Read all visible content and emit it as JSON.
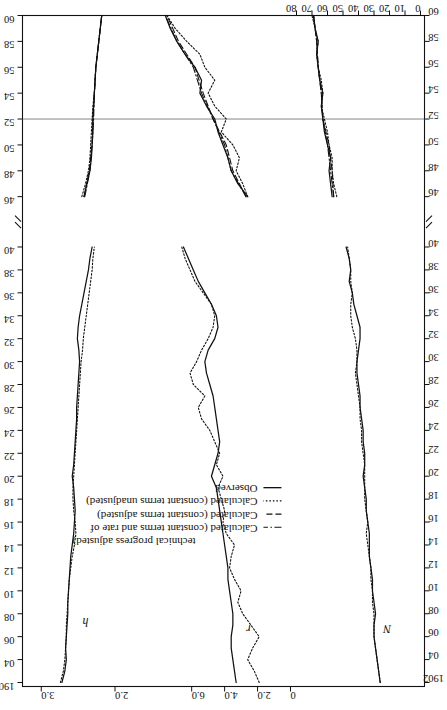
{
  "figure": {
    "orientation": "rotated-90-ccw",
    "background": "#ffffff",
    "ink": "#111111"
  },
  "legend": {
    "position": "center-bottom-of-rotated-figure",
    "items": [
      {
        "label": "Observed",
        "style": "solid"
      },
      {
        "label": "Calculated (constant terms unadjusted)",
        "style": "dotted"
      },
      {
        "label": "Calculated (constant terms adjusted)",
        "style": "dashed"
      },
      {
        "label": "Calculated (constant terms and rate of",
        "style": "dashdot"
      },
      {
        "label": "technical progress adjusted)",
        "style": "continuation"
      }
    ]
  },
  "series_labels": {
    "h": "h",
    "r": "r",
    "N": "N"
  },
  "axis_break": {
    "symbol": "//",
    "between": [
      "40",
      "46"
    ]
  },
  "chart_data": {
    "type": "line",
    "title": "",
    "subtitle": "",
    "xlabel": "",
    "ylabel": "",
    "grid": false,
    "legend_position": "bottom-center",
    "x_axis": {
      "name": "year",
      "tick_labels": [
        "1902",
        "04",
        "06",
        "08",
        "10",
        "12",
        "14",
        "16",
        "18",
        "20",
        "22",
        "24",
        "26",
        "28",
        "30",
        "32",
        "34",
        "36",
        "38",
        "40",
        "//",
        "46",
        "48",
        "50",
        "52",
        "54",
        "56",
        "58",
        "60"
      ],
      "break_after": "40",
      "break_before": "46",
      "duplicated_on_opposite_side": true
    },
    "y_axes": [
      {
        "panel": "h",
        "tick_labels": [
          "3.0",
          "2.0"
        ],
        "values": [
          3.0,
          2.0
        ],
        "note": "hours index panel, upper strip"
      },
      {
        "panel": "r",
        "tick_labels": [
          "6.0",
          "4.0",
          "2.0",
          "0"
        ],
        "values": [
          6.0,
          4.0,
          2.0,
          0
        ],
        "note": "rate panel, middle strip"
      },
      {
        "panel": "N",
        "tick_labels": [
          "80",
          "70",
          "60",
          "50",
          "40",
          "30",
          "20",
          "10",
          "0"
        ],
        "values": [
          80,
          70,
          60,
          50,
          40,
          30,
          20,
          10,
          0
        ],
        "note": "employment panel, lower strip; scale drawn on opposite side"
      }
    ],
    "panels": [
      {
        "name": "h",
        "label": "h",
        "ylim": [
          1.6,
          3.2
        ],
        "series": [
          {
            "name": "Observed",
            "style": "solid",
            "x": [
              1902,
              1903,
              1904,
              1905,
              1906,
              1907,
              1908,
              1909,
              1910,
              1911,
              1912,
              1913,
              1914,
              1915,
              1916,
              1917,
              1918,
              1919,
              1920,
              1921,
              1922,
              1923,
              1924,
              1925,
              1926,
              1927,
              1928,
              1929,
              1930,
              1931,
              1932,
              1933,
              1934,
              1935,
              1936,
              1937,
              1938,
              1939,
              1940,
              1946,
              1947,
              1948,
              1949,
              1950,
              1951,
              1952,
              1953,
              1954,
              1955,
              1956,
              1957,
              1958,
              1959,
              1960
            ],
            "y": [
              2.72,
              2.68,
              2.66,
              2.67,
              2.66,
              2.65,
              2.64,
              2.64,
              2.63,
              2.62,
              2.61,
              2.6,
              2.58,
              2.56,
              2.55,
              2.54,
              2.55,
              2.56,
              2.58,
              2.56,
              2.55,
              2.54,
              2.53,
              2.52,
              2.52,
              2.51,
              2.5,
              2.49,
              2.48,
              2.49,
              2.51,
              2.5,
              2.48,
              2.45,
              2.42,
              2.39,
              2.36,
              2.34,
              2.31,
              2.42,
              2.38,
              2.34,
              2.32,
              2.31,
              2.3,
              2.3,
              2.29,
              2.28,
              2.27,
              2.26,
              2.24,
              2.22,
              2.2,
              2.18
            ]
          },
          {
            "name": "Calculated (constant terms unadjusted)",
            "style": "dotted",
            "x": [
              1902,
              1903,
              1904,
              1905,
              1906,
              1907,
              1908,
              1909,
              1910,
              1911,
              1912,
              1913,
              1914,
              1915,
              1916,
              1917,
              1918,
              1919,
              1920,
              1921,
              1922,
              1923,
              1924,
              1925,
              1926,
              1927,
              1928,
              1929,
              1930,
              1931,
              1932,
              1933,
              1934,
              1935,
              1936,
              1937,
              1938,
              1939,
              1940,
              1946,
              1947,
              1948,
              1949,
              1950,
              1951,
              1952,
              1953,
              1954,
              1955,
              1956,
              1957,
              1958,
              1959,
              1960
            ],
            "y": [
              2.74,
              2.7,
              2.68,
              2.67,
              2.66,
              2.66,
              2.65,
              2.64,
              2.63,
              2.62,
              2.6,
              2.58,
              2.55,
              2.53,
              2.54,
              2.56,
              2.57,
              2.57,
              2.56,
              2.55,
              2.54,
              2.53,
              2.52,
              2.51,
              2.5,
              2.49,
              2.48,
              2.47,
              2.46,
              2.44,
              2.43,
              2.41,
              2.39,
              2.37,
              2.35,
              2.33,
              2.31,
              2.3,
              2.28,
              2.45,
              2.4,
              2.36,
              2.34,
              2.33,
              2.32,
              2.31,
              2.3,
              2.28,
              2.27,
              2.26,
              2.24,
              2.22,
              2.2,
              2.18
            ]
          },
          {
            "name": "Calculated (constant terms adjusted)",
            "style": "dashed",
            "x": [
              1946,
              1948,
              1950,
              1952,
              1954,
              1956,
              1958,
              1960
            ],
            "y": [
              2.42,
              2.35,
              2.31,
              2.3,
              2.28,
              2.26,
              2.22,
              2.18
            ]
          },
          {
            "name": "Calculated (constant terms and rate of technical progress adjusted)",
            "style": "dashdot",
            "x": [
              1946,
              1948,
              1950,
              1952,
              1954,
              1956,
              1958,
              1960
            ],
            "y": [
              2.41,
              2.34,
              2.31,
              2.29,
              2.28,
              2.26,
              2.22,
              2.18
            ]
          }
        ]
      },
      {
        "name": "r",
        "label": "r",
        "ylim": [
          0,
          8.5
        ],
        "series": [
          {
            "name": "Observed",
            "style": "solid",
            "x": [
              1902,
              1903,
              1904,
              1905,
              1906,
              1907,
              1908,
              1909,
              1910,
              1911,
              1912,
              1913,
              1914,
              1915,
              1916,
              1917,
              1918,
              1919,
              1920,
              1921,
              1922,
              1923,
              1924,
              1925,
              1926,
              1927,
              1928,
              1929,
              1930,
              1931,
              1932,
              1933,
              1934,
              1935,
              1936,
              1937,
              1938,
              1939,
              1940,
              1946,
              1947,
              1948,
              1949,
              1950,
              1951,
              1952,
              1953,
              1954,
              1955,
              1956,
              1957,
              1958,
              1959,
              1960
            ],
            "y": [
              3.3,
              3.4,
              3.5,
              3.6,
              3.6,
              3.5,
              3.5,
              3.6,
              3.7,
              3.8,
              3.8,
              3.9,
              4.0,
              4.1,
              4.2,
              4.3,
              4.4,
              4.5,
              4.8,
              4.6,
              4.4,
              4.3,
              4.4,
              4.5,
              4.6,
              4.7,
              4.9,
              5.1,
              5.2,
              5.0,
              4.6,
              4.4,
              4.5,
              4.8,
              5.2,
              5.6,
              5.9,
              6.2,
              6.5,
              2.6,
              3.2,
              3.6,
              3.8,
              4.1,
              4.4,
              4.6,
              5.1,
              5.5,
              5.4,
              5.8,
              6.4,
              6.9,
              7.3,
              7.6
            ]
          },
          {
            "name": "Calculated (constant terms unadjusted)",
            "style": "dotted",
            "x": [
              1902,
              1903,
              1904,
              1905,
              1906,
              1907,
              1908,
              1909,
              1910,
              1911,
              1912,
              1913,
              1914,
              1915,
              1916,
              1917,
              1918,
              1919,
              1920,
              1921,
              1922,
              1923,
              1924,
              1925,
              1926,
              1927,
              1928,
              1929,
              1930,
              1931,
              1932,
              1933,
              1934,
              1935,
              1936,
              1937,
              1938,
              1939,
              1940,
              1946,
              1947,
              1948,
              1949,
              1950,
              1951,
              1952,
              1953,
              1954,
              1955,
              1956,
              1957,
              1958,
              1959,
              1960
            ],
            "y": [
              1.9,
              2.2,
              2.6,
              2.3,
              1.9,
              2.4,
              2.9,
              3.2,
              3.0,
              3.4,
              3.7,
              3.6,
              3.4,
              3.9,
              4.1,
              4.0,
              4.2,
              4.4,
              4.1,
              4.5,
              4.3,
              4.6,
              4.9,
              5.4,
              5.6,
              5.2,
              5.9,
              6.1,
              5.7,
              5.4,
              5.0,
              4.7,
              4.6,
              4.8,
              5.3,
              5.8,
              6.1,
              6.4,
              6.6,
              2.6,
              2.9,
              3.3,
              3.1,
              3.5,
              4.2,
              3.9,
              4.6,
              5.0,
              4.6,
              5.2,
              5.5,
              6.3,
              7.0,
              7.5
            ]
          },
          {
            "name": "Calculated (constant terms adjusted)",
            "style": "dashed",
            "x": [
              1946,
              1948,
              1950,
              1952,
              1954,
              1956,
              1958,
              1960
            ],
            "y": [
              2.7,
              3.5,
              3.9,
              4.7,
              5.3,
              5.8,
              6.8,
              7.5
            ]
          },
          {
            "name": "Calculated (constant terms and rate of technical progress adjusted)",
            "style": "dashdot",
            "x": [
              1946,
              1948,
              1950,
              1952,
              1954,
              1956,
              1958,
              1960
            ],
            "y": [
              2.7,
              3.6,
              4.0,
              4.7,
              5.4,
              5.9,
              6.9,
              7.6
            ]
          }
        ]
      },
      {
        "name": "N",
        "label": "N",
        "ylim": [
          0,
          80
        ],
        "series": [
          {
            "name": "Observed",
            "style": "solid",
            "x": [
              1902,
              1903,
              1904,
              1905,
              1906,
              1907,
              1908,
              1909,
              1910,
              1911,
              1912,
              1913,
              1914,
              1915,
              1916,
              1917,
              1918,
              1919,
              1920,
              1921,
              1922,
              1923,
              1924,
              1925,
              1926,
              1927,
              1928,
              1929,
              1930,
              1931,
              1932,
              1933,
              1934,
              1935,
              1936,
              1937,
              1938,
              1939,
              1940,
              1946,
              1947,
              1948,
              1949,
              1950,
              1951,
              1952,
              1953,
              1954,
              1955,
              1956,
              1957,
              1958,
              1959,
              1960
            ],
            "y": [
              26,
              27,
              28,
              29,
              30,
              30,
              29,
              30,
              31,
              31,
              32,
              33,
              33,
              33,
              34,
              35,
              35,
              36,
              37,
              36,
              36,
              37,
              37,
              38,
              39,
              39,
              40,
              41,
              41,
              40,
              39,
              39,
              41,
              43,
              44,
              46,
              45,
              46,
              48,
              57,
              58,
              59,
              58,
              60,
              62,
              63,
              64,
              63,
              65,
              66,
              67,
              66,
              68,
              69
            ]
          },
          {
            "name": "Calculated (constant terms unadjusted)",
            "style": "dotted",
            "x": [
              1902,
              1903,
              1904,
              1905,
              1906,
              1907,
              1908,
              1909,
              1910,
              1911,
              1912,
              1913,
              1914,
              1915,
              1916,
              1917,
              1918,
              1919,
              1920,
              1921,
              1922,
              1923,
              1924,
              1925,
              1926,
              1927,
              1928,
              1929,
              1930,
              1931,
              1932,
              1933,
              1934,
              1935,
              1936,
              1937,
              1938,
              1939,
              1940,
              1946,
              1947,
              1948,
              1949,
              1950,
              1951,
              1952,
              1953,
              1954,
              1955,
              1956,
              1957,
              1958,
              1959,
              1960
            ],
            "y": [
              26,
              27,
              28,
              29,
              30,
              30,
              30,
              31,
              31,
              32,
              32,
              33,
              34,
              35,
              34,
              35,
              36,
              36,
              36,
              36,
              37,
              38,
              38,
              39,
              39,
              40,
              41,
              42,
              41,
              41,
              42,
              44,
              45,
              45,
              44,
              45,
              45,
              46,
              47,
              54,
              56,
              57,
              57,
              59,
              60,
              62,
              64,
              63,
              64,
              66,
              67,
              66,
              68,
              70
            ]
          },
          {
            "name": "Calculated (constant terms adjusted)",
            "style": "dashed",
            "x": [
              1946,
              1948,
              1950,
              1952,
              1954,
              1956,
              1958,
              1960
            ],
            "y": [
              56,
              57,
              59,
              63,
              64,
              66,
              67,
              69
            ]
          },
          {
            "name": "Calculated (constant terms and rate of technical progress adjusted)",
            "style": "dashdot",
            "x": [
              1946,
              1948,
              1950,
              1952,
              1954,
              1956,
              1958,
              1960
            ],
            "y": [
              56,
              58,
              60,
              63,
              64,
              66,
              67,
              69
            ]
          }
        ]
      }
    ],
    "annotations": [
      {
        "text": "h",
        "panel": "h"
      },
      {
        "text": "r",
        "panel": "r"
      },
      {
        "text": "N",
        "panel": "N"
      }
    ]
  }
}
